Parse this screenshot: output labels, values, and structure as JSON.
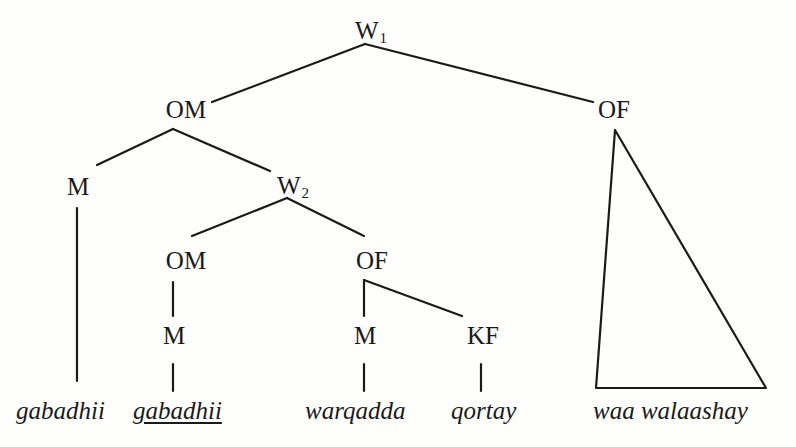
{
  "diagram": {
    "type": "syntax-tree",
    "nodes": {
      "w1": {
        "label": "W",
        "sub": "1"
      },
      "om_top": {
        "label": "OM"
      },
      "of_top": {
        "label": "OF"
      },
      "m_left": {
        "label": "M"
      },
      "w2": {
        "label": "W",
        "sub": "2"
      },
      "om_inner": {
        "label": "OM"
      },
      "of_inner": {
        "label": "OF"
      },
      "m_om": {
        "label": "M"
      },
      "m_of": {
        "label": "M"
      },
      "kf": {
        "label": "KF"
      }
    },
    "leaves": [
      {
        "text": "gabadhii",
        "underlined": false
      },
      {
        "text": "gabadhii",
        "underlined": true
      },
      {
        "text": "warqadda",
        "underlined": false
      },
      {
        "text": "qortay",
        "underlined": false
      },
      {
        "text": "waa walaashay",
        "underlined": false
      }
    ],
    "edges": [
      [
        "W1",
        "OM"
      ],
      [
        "W1",
        "OF"
      ],
      [
        "OM",
        "M"
      ],
      [
        "OM",
        "W2"
      ],
      [
        "W2",
        "OM"
      ],
      [
        "W2",
        "OF"
      ],
      [
        "OM",
        "M"
      ],
      [
        "OF",
        "M"
      ],
      [
        "OF",
        "KF"
      ],
      [
        "M",
        "gabadhii"
      ],
      [
        "M",
        "gabadhii"
      ],
      [
        "M",
        "warqadda"
      ],
      [
        "KF",
        "qortay"
      ],
      [
        "OF",
        "triangle: waa walaashay"
      ]
    ]
  }
}
